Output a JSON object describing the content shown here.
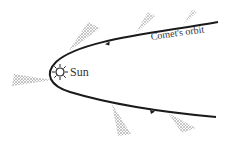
{
  "diagram": {
    "labels": {
      "sun": "Sun",
      "orbit": "Comet's orbit"
    },
    "colors": {
      "orbit": "#1a1a1a",
      "tail": "#555555",
      "background": "#ffffff"
    },
    "elements": [
      {
        "type": "sun-icon",
        "x": 59,
        "y": 72
      },
      {
        "type": "orbit-path",
        "shape": "parabola",
        "direction": "counterclockwise-inward-top-outward-bottom"
      },
      {
        "type": "comet-tail",
        "count": 5
      }
    ]
  }
}
